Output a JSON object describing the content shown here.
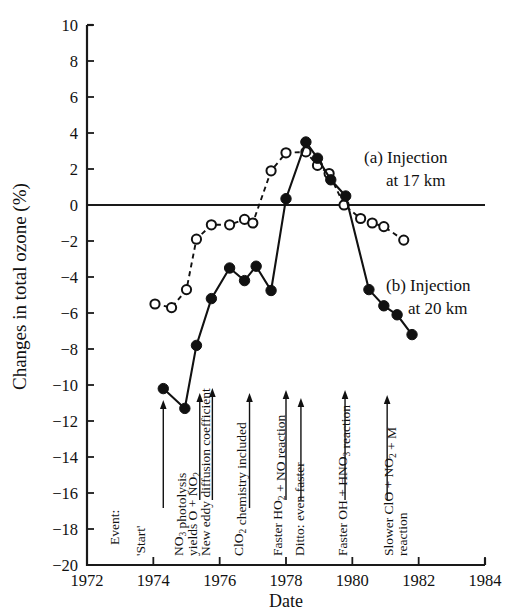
{
  "chart_data": {
    "type": "line",
    "title": "",
    "xlabel": "Date",
    "ylabel": "Changes in total ozone (%)",
    "xlim": [
      1972,
      1984
    ],
    "ylim": [
      -20,
      10
    ],
    "xticks": [
      1972,
      1974,
      1976,
      1978,
      1980,
      1982,
      1984
    ],
    "yticks": [
      10,
      8,
      6,
      4,
      2,
      0,
      -2,
      -4,
      -6,
      -8,
      -10,
      -12,
      -14,
      -16,
      -18,
      -20
    ],
    "grid": false,
    "legend_position": "right-inside",
    "zero_line": true,
    "series": [
      {
        "name": "(a) Injection at 17 km",
        "marker": "open-circle",
        "linestyle": "dashed",
        "x": [
          1974.05,
          1974.55,
          1975.0,
          1975.3,
          1975.75,
          1976.3,
          1976.75,
          1977.0,
          1977.55,
          1978.0,
          1978.6,
          1978.95,
          1979.3,
          1979.75,
          1980.25,
          1980.6,
          1980.95,
          1981.55
        ],
        "y": [
          -5.5,
          -5.7,
          -4.7,
          -1.9,
          -1.1,
          -1.1,
          -0.8,
          -1.0,
          1.9,
          2.9,
          2.95,
          2.2,
          1.75,
          0.0,
          -0.75,
          -1.0,
          -1.2,
          -1.95
        ]
      },
      {
        "name": "(b) Injection at 20 km",
        "marker": "filled-circle",
        "linestyle": "solid",
        "x": [
          1974.3,
          1974.95,
          1975.3,
          1975.75,
          1976.3,
          1976.75,
          1977.1,
          1977.55,
          1978.0,
          1978.6,
          1978.95,
          1979.35,
          1979.8,
          1980.5,
          1980.95,
          1981.35,
          1981.8
        ],
        "y": [
          -10.2,
          -11.3,
          -7.8,
          -5.2,
          -3.5,
          -4.2,
          -3.4,
          -4.75,
          0.35,
          3.5,
          2.6,
          1.4,
          0.5,
          -4.7,
          -5.6,
          -6.1,
          -7.2
        ]
      }
    ]
  },
  "legend": [
    {
      "label_line1": "(a) Injection",
      "label_line2": "at 17 km"
    },
    {
      "label_line1": "(b) Injection",
      "label_line2": "at 20 km"
    }
  ],
  "events": {
    "header": "Event:",
    "items": [
      {
        "label": "'Start'",
        "year": 1974.3
      },
      {
        "label": "NO3 photolysis yields O + NO2",
        "year": 1975.4
      },
      {
        "label": "New eddy diffusion coefficient",
        "year": 1975.75
      },
      {
        "label": "ClO2 chemistry included",
        "year": 1976.85
      },
      {
        "label": "Faster HO2 + NO reaction",
        "year": 1978.0
      },
      {
        "label": "Ditto: even faster",
        "year": 1978.45
      },
      {
        "label": "Faster OH + HNO3 reaction",
        "year": 1979.75
      },
      {
        "label": "Slower ClO + NO2 + M reaction",
        "year": 1981.0
      }
    ]
  },
  "axes": {
    "x_title": "Date",
    "y_title": "Changes in total ozone (%)",
    "x_tick_labels": [
      "1972",
      "1974",
      "1976",
      "1978",
      "1980",
      "1982",
      "1984"
    ],
    "y_tick_labels": [
      "10",
      "8",
      "6",
      "4",
      "2",
      "0",
      "−2",
      "−4",
      "−6",
      "−8",
      "−10",
      "−12",
      "−14",
      "−16",
      "−18",
      "−20"
    ]
  },
  "colors": {
    "ink": "#111111",
    "paper": "#ffffff"
  }
}
